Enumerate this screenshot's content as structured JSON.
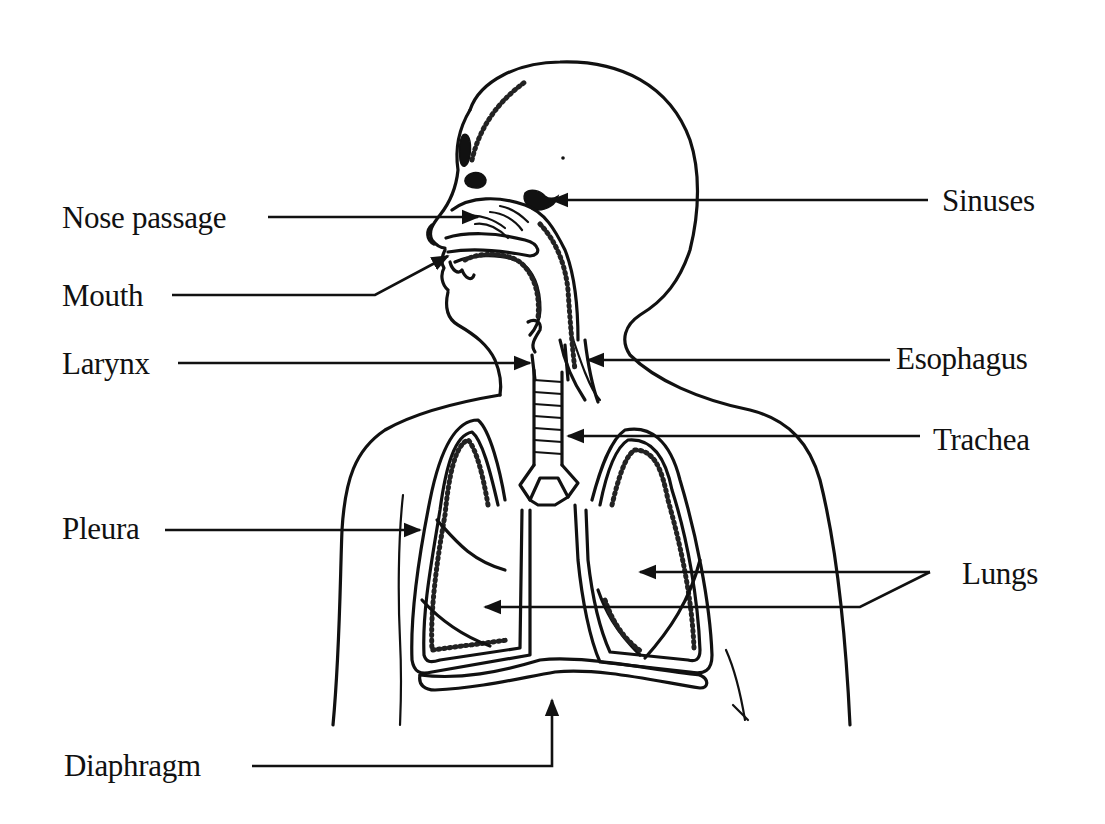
{
  "labels": {
    "nose_passage": "Nose passage",
    "mouth": "Mouth",
    "larynx": "Larynx",
    "pleura": "Pleura",
    "diaphragm": "Diaphragm",
    "sinuses": "Sinuses",
    "esophagus": "Esophagus",
    "trachea": "Trachea",
    "lungs": "Lungs"
  },
  "colors": {
    "ink": "#111111",
    "background": "#ffffff"
  }
}
